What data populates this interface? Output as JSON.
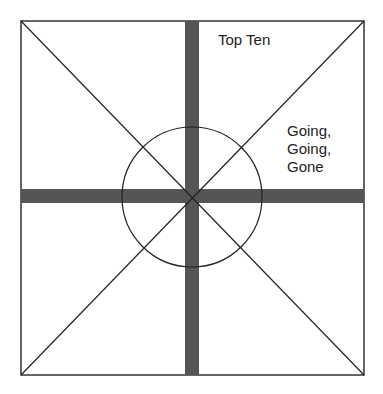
{
  "labels": {
    "top": "Top Ten",
    "right_line1": "Going,",
    "right_line2": "Going,",
    "right_line3": "Gone"
  },
  "colors": {
    "bar": "#555555",
    "line": "#222222",
    "background": "#ffffff"
  }
}
